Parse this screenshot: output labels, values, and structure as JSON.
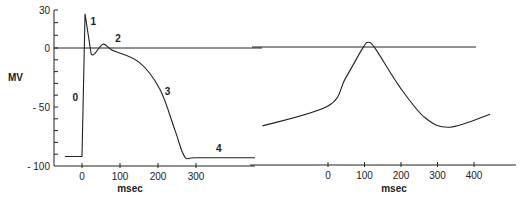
{
  "chart_data": [
    {
      "type": "line",
      "title": "",
      "xlabel": "msec",
      "ylabel": "MV",
      "xlim": [
        -50,
        460
      ],
      "ylim": [
        -100,
        30
      ],
      "x_ticks": [
        0,
        100,
        200,
        300
      ],
      "x_tick_labels": [
        "0",
        "100",
        "200",
        "300"
      ],
      "y_ticks": [
        30,
        0,
        -50,
        -100
      ],
      "y_tick_labels": [
        "30",
        "0",
        "- 50",
        "- 100"
      ],
      "reference_line": {
        "y": 0,
        "label": "0"
      },
      "series": [
        {
          "name": "ventricular action potential",
          "x": [
            -45,
            0,
            8,
            24,
            55,
            80,
            150,
            205,
            245,
            270,
            300,
            455
          ],
          "y": [
            -92,
            -92,
            27,
            -5,
            3,
            -2,
            -12,
            -35,
            -70,
            -92,
            -93,
            -93
          ]
        }
      ],
      "annotations": [
        {
          "text": "0",
          "x": -18,
          "y": -45
        },
        {
          "text": "1",
          "x": 30,
          "y": 18
        },
        {
          "text": "2",
          "x": 95,
          "y": 5
        },
        {
          "text": "3",
          "x": 225,
          "y": -40
        },
        {
          "text": "4",
          "x": 360,
          "y": -88
        }
      ]
    },
    {
      "type": "line",
      "title": "",
      "xlabel": "msec",
      "ylabel": "",
      "xlim": [
        -180,
        450
      ],
      "ylim": [
        -100,
        30
      ],
      "x_ticks": [
        0,
        100,
        200,
        300,
        400
      ],
      "x_tick_labels": [
        "0",
        "100",
        "200",
        "300",
        "400"
      ],
      "reference_line": {
        "y": 0
      },
      "series": [
        {
          "name": "pacemaker action potential",
          "x": [
            -180,
            0,
            47,
            93,
            110,
            131,
            197,
            266,
            334,
            444
          ],
          "y": [
            -67,
            -50,
            -27,
            -2,
            4,
            -2,
            -34,
            -60,
            -68,
            -57
          ]
        }
      ],
      "annotations": []
    }
  ]
}
